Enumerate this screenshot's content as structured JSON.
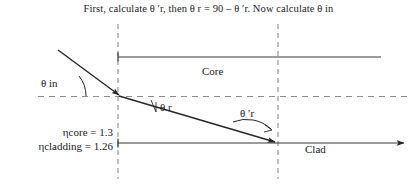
{
  "figure": {
    "title": "First, calculate θ ′r, then θ r = 90 – θ ′r. Now calculate θ in",
    "type": "optics-ray-diagram",
    "background_color": "#ffffff",
    "line_color": "#262626",
    "dash_color": "#808080"
  },
  "labels": {
    "theta_in": "θ in",
    "theta_r": "θ r",
    "theta_prime_r": "θ ′r",
    "core": "Core",
    "clad": "Clad",
    "n_core": "ηcore = 1.3",
    "n_cladding": "ηcladding = 1.26"
  },
  "values": {
    "n_core": 1.3,
    "n_cladding": 1.26,
    "relation": "θ r = 90 – θ ′r"
  },
  "geometry": {
    "vertical_dashed_left_x": 118,
    "vertical_dashed_right_x": 278,
    "core_top_line_y": 57,
    "axis_dashed_line_y": 96,
    "core_bottom_line_y": 143,
    "incident_ray": {
      "x1": 58,
      "y1": 50,
      "x2": 122,
      "y2": 97
    },
    "refracted_ray": {
      "x1": 120,
      "y1": 96,
      "x2": 279,
      "y2": 143
    }
  }
}
